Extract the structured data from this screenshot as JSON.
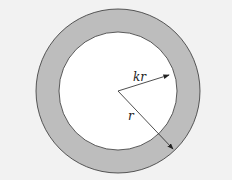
{
  "diagram": {
    "title": "",
    "labels": {
      "inner_radius": "kr",
      "outer_radius": "r"
    },
    "colors": {
      "background": "#f2f2f2",
      "ring": "#bdbdbd",
      "inner": "#ffffff",
      "stroke": "#333333"
    },
    "geometry": {
      "cx": 118,
      "cy": 91,
      "outer_r": 82,
      "inner_r": 59
    }
  }
}
